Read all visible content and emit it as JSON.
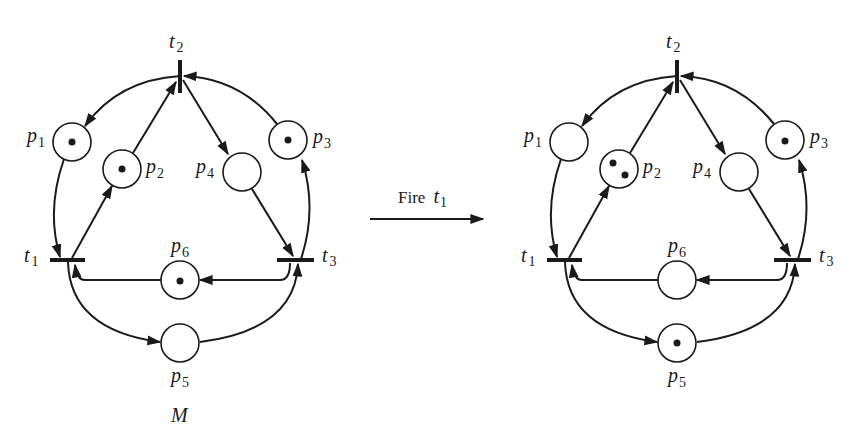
{
  "colors": {
    "ink": "#1a1a1a",
    "background": "#ffffff"
  },
  "transition_arrow": {
    "label": "Fire",
    "transition": "t",
    "transition_sub": "1"
  },
  "nets": [
    {
      "caption": "M",
      "places": [
        {
          "id": "p1",
          "name": "p",
          "sub": "1",
          "tokens": 1
        },
        {
          "id": "p2",
          "name": "p",
          "sub": "2",
          "tokens": 1
        },
        {
          "id": "p3",
          "name": "p",
          "sub": "3",
          "tokens": 1
        },
        {
          "id": "p4",
          "name": "p",
          "sub": "4",
          "tokens": 0
        },
        {
          "id": "p5",
          "name": "p",
          "sub": "5",
          "tokens": 0
        },
        {
          "id": "p6",
          "name": "p",
          "sub": "6",
          "tokens": 1
        }
      ],
      "transitions": [
        {
          "id": "t1",
          "name": "t",
          "sub": "1"
        },
        {
          "id": "t2",
          "name": "t",
          "sub": "2"
        },
        {
          "id": "t3",
          "name": "t",
          "sub": "3"
        }
      ]
    },
    {
      "caption": "",
      "places": [
        {
          "id": "p1",
          "name": "p",
          "sub": "1",
          "tokens": 0
        },
        {
          "id": "p2",
          "name": "p",
          "sub": "2",
          "tokens": 2
        },
        {
          "id": "p3",
          "name": "p",
          "sub": "3",
          "tokens": 1
        },
        {
          "id": "p4",
          "name": "p",
          "sub": "4",
          "tokens": 0
        },
        {
          "id": "p5",
          "name": "p",
          "sub": "5",
          "tokens": 1
        },
        {
          "id": "p6",
          "name": "p",
          "sub": "6",
          "tokens": 0
        }
      ],
      "transitions": [
        {
          "id": "t1",
          "name": "t",
          "sub": "1"
        },
        {
          "id": "t2",
          "name": "t",
          "sub": "2"
        },
        {
          "id": "t3",
          "name": "t",
          "sub": "3"
        }
      ]
    }
  ],
  "arcs": [
    {
      "from": "t2",
      "to": "p1"
    },
    {
      "from": "p1",
      "to": "t1"
    },
    {
      "from": "t1",
      "to": "p2"
    },
    {
      "from": "p2",
      "to": "t2"
    },
    {
      "from": "t2",
      "to": "p4"
    },
    {
      "from": "p4",
      "to": "t3"
    },
    {
      "from": "t3",
      "to": "p3"
    },
    {
      "from": "p3",
      "to": "t2"
    },
    {
      "from": "t3",
      "to": "p6"
    },
    {
      "from": "p6",
      "to": "t1"
    },
    {
      "from": "t1",
      "to": "p5"
    },
    {
      "from": "p5",
      "to": "t3"
    }
  ]
}
